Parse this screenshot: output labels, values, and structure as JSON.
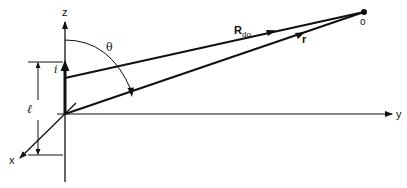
{
  "diagram": {
    "type": "geometry-vector-diagram",
    "colors": {
      "ink": "#111111",
      "background": "#ffffff"
    },
    "labels": {
      "z_axis": "z",
      "y_axis": "y",
      "x_axis": "x",
      "current": "i",
      "length": "ℓ",
      "angle": "θ",
      "observation_point": "o",
      "vector_r": "r",
      "vector_R_main": "R",
      "vector_R_sub": "do"
    },
    "elements": [
      {
        "id": "z-axis",
        "description": "vertical axis with arrow up"
      },
      {
        "id": "y-axis",
        "description": "horizontal axis with arrow right"
      },
      {
        "id": "x-axis",
        "description": "diagonal axis toward lower-left"
      },
      {
        "id": "current-element",
        "description": "thick vertical segment with arrow, labelled i"
      },
      {
        "id": "length-dimension",
        "description": "dimension line labelled ℓ"
      },
      {
        "id": "vector-R",
        "description": "vector from top of current element to point o"
      },
      {
        "id": "vector-r",
        "description": "vector from origin to point o"
      },
      {
        "id": "angle-theta",
        "description": "arc from z-axis to vector r, labelled θ"
      },
      {
        "id": "point-o",
        "description": "observation point dot"
      }
    ]
  }
}
